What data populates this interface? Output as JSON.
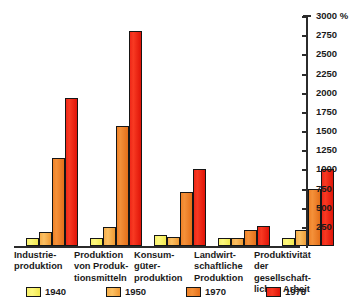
{
  "chart_data": {
    "type": "bar",
    "title": "",
    "subtitle": "",
    "xlabel": "",
    "ylabel": "",
    "unit_label": "%",
    "ylim": [
      0,
      3000
    ],
    "grid": false,
    "legend_position": "bottom",
    "y_ticks": [
      3000,
      2750,
      2500,
      2250,
      2000,
      1750,
      1500,
      1250,
      1000,
      750,
      500,
      250
    ],
    "y_tick_labels": [
      "3000 %",
      "2750",
      "2500",
      "2250",
      "2000",
      "1750",
      "1500",
      "1250",
      "1000",
      "750",
      "500",
      "250"
    ],
    "categories": [
      "Industrie-\nproduktion",
      "Produktion\nvon Produk-\ntionsmitteln",
      "Konsum-\ngüter-\nproduktion",
      "Landwirt-\nschaftliche\nProduktion",
      "Produktivität\nder gesellschaft-\nlichen Arbeit"
    ],
    "series": [
      {
        "name": "1940",
        "color": "#f7f06a",
        "values": [
          100,
          100,
          140,
          100,
          100
        ]
      },
      {
        "name": "1950",
        "color": "#f6ae4a",
        "values": [
          180,
          250,
          115,
          105,
          205
        ]
      },
      {
        "name": "1970",
        "color": "#ef8126",
        "values": [
          1150,
          1560,
          700,
          215,
          740
        ]
      },
      {
        "name": "1978",
        "color": "#ef2718",
        "values": [
          1930,
          2800,
          1000,
          255,
          1000
        ]
      }
    ]
  },
  "legend": {
    "items": [
      {
        "label": "1940",
        "swatch_class": "y1940"
      },
      {
        "label": "1950",
        "swatch_class": "y1950"
      },
      {
        "label": "1970",
        "swatch_class": "y1970"
      },
      {
        "label": "1978",
        "swatch_class": "y1978"
      }
    ]
  }
}
